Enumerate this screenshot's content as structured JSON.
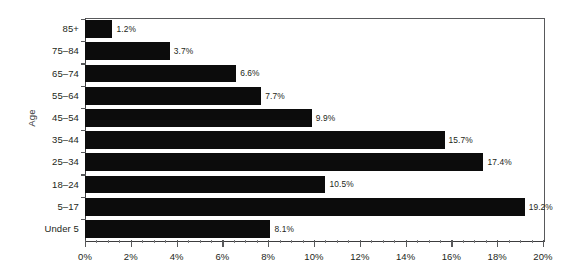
{
  "chart_data": {
    "type": "bar",
    "orientation": "horizontal",
    "title": "",
    "subtitle": "",
    "xlabel": "",
    "ylabel": "Age",
    "xlim": [
      0,
      20
    ],
    "ylim": null,
    "grid": false,
    "legend": null,
    "bar_color": "#0c0c0c",
    "axis_color": "#58595b",
    "categories": [
      "85+",
      "75–84",
      "65–74",
      "55–64",
      "45–54",
      "35–44",
      "25–34",
      "18–24",
      "5–17",
      "Under 5"
    ],
    "values": [
      1.2,
      3.7,
      6.6,
      7.7,
      9.9,
      15.7,
      17.4,
      10.5,
      19.2,
      8.1
    ],
    "data_labels": [
      "1.2%",
      "3.7%",
      "6.6%",
      "7.7%",
      "9.9%",
      "15.7%",
      "17.4%",
      "10.5%",
      "19.2%",
      "8.1%"
    ],
    "xticks": [
      0,
      2,
      4,
      6,
      8,
      10,
      12,
      14,
      16,
      18,
      20
    ],
    "xticklabels": [
      "0%",
      "2%",
      "4%",
      "6%",
      "8%",
      "10%",
      "12%",
      "14%",
      "16%",
      "18%",
      "20%"
    ],
    "xtick_minor_step": 0.5
  }
}
